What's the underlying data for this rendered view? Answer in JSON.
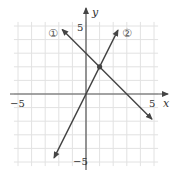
{
  "chart_data": {
    "type": "line",
    "title": "",
    "xlabel": "x",
    "ylabel": "y",
    "xlim": [
      -5.5,
      5.5
    ],
    "ylim": [
      -5.5,
      5.5
    ],
    "grid": true,
    "x_ticks_labeled": [
      -5,
      5
    ],
    "y_ticks_labeled": [
      5,
      -5
    ],
    "tick_labels": {
      "x_neg": "−5",
      "x_pos": "5",
      "y_pos": "5",
      "y_neg": "−5"
    },
    "series": [
      {
        "name": "①",
        "equation": "y = -x + 3",
        "points": [
          [
            -1.75,
            4.75
          ],
          [
            4.85,
            -1.85
          ]
        ],
        "arrows": "both"
      },
      {
        "name": "②",
        "equation": "y = 2x",
        "points": [
          [
            -2.35,
            -4.7
          ],
          [
            2.35,
            4.7
          ]
        ],
        "arrows": "both"
      }
    ],
    "annotations": [
      {
        "type": "point",
        "x": 1,
        "y": 2,
        "label": "intersection"
      }
    ],
    "legend": {
      "position": "inline",
      "labels": [
        "①",
        "②"
      ]
    }
  }
}
